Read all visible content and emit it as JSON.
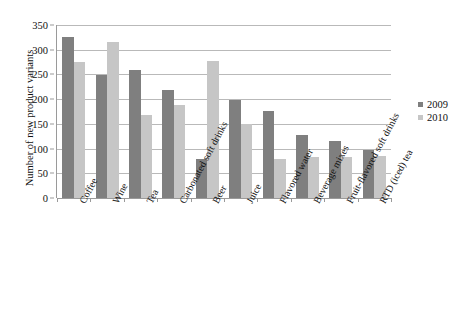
{
  "chart_data": {
    "type": "bar",
    "title": "",
    "xlabel": "",
    "ylabel": "Number of new product variants",
    "ylim": [
      0,
      350
    ],
    "ytick_step": 50,
    "yticks": [
      0,
      50,
      100,
      150,
      200,
      250,
      300,
      350
    ],
    "grid": true,
    "legend_position": "right",
    "categories": [
      "Coffee",
      "Wine",
      "Tea",
      "Carbonated soft drinks",
      "Beer",
      "Juice",
      "Flavored water",
      "Beverage mixes",
      "Fruit-flavored soft drinks",
      "RTD (iced) tea"
    ],
    "series": [
      {
        "name": "2009",
        "color": "#7f7f7f",
        "values": [
          325,
          249,
          259,
          218,
          78,
          199,
          177,
          128,
          116,
          97
        ]
      },
      {
        "name": "2010",
        "color": "#c6c6c6",
        "values": [
          275,
          315,
          168,
          188,
          278,
          149,
          78,
          83,
          82,
          86
        ]
      }
    ]
  },
  "legend": {
    "items": [
      {
        "label": "2009",
        "color": "#7f7f7f"
      },
      {
        "label": "2010",
        "color": "#c6c6c6"
      }
    ]
  }
}
